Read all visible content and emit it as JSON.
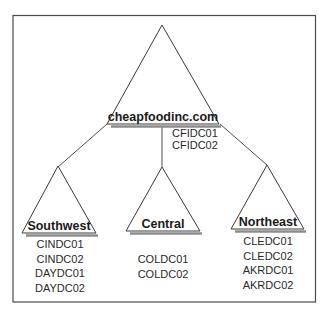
{
  "diagram": {
    "root": {
      "name": "cheapfoodinc.com",
      "domain_controllers": [
        "CFIDC01",
        "CFIDC02"
      ]
    },
    "children": [
      {
        "name": "Southwest",
        "domain_controllers": [
          "CINDC01",
          "CINDC02",
          "DAYDC01",
          "DAYDC02"
        ]
      },
      {
        "name": "Central",
        "domain_controllers": [
          "COLDC01",
          "COLDC02"
        ]
      },
      {
        "name": "Northeast",
        "domain_controllers": [
          "CLEDC01",
          "CLEDC02",
          "AKRDC01",
          "AKRDC02"
        ]
      }
    ],
    "colors": {
      "stroke": "#3a3a3a",
      "shadow": "#8c8c8c",
      "background": "#ffffff"
    }
  }
}
